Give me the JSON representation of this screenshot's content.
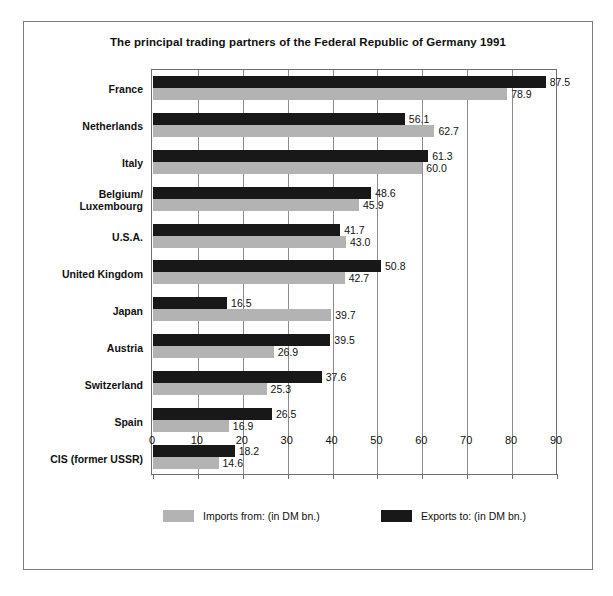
{
  "chart_data": {
    "type": "bar",
    "orientation": "horizontal",
    "title": "The principal trading partners of the Federal Republic of Germany 1991",
    "xlabel": "",
    "ylabel": "",
    "xlim": [
      0,
      90
    ],
    "xticks": [
      0,
      10,
      20,
      30,
      40,
      50,
      60,
      70,
      80,
      90
    ],
    "xtick_labels": [
      "0",
      "10",
      "20",
      "30",
      "40",
      "50",
      "60",
      "70",
      "80",
      "90"
    ],
    "grid": "vertical",
    "legend_position": "bottom",
    "categories": [
      "France",
      "Netherlands",
      "Italy",
      "Belgium/\nLuxembourg",
      "U.S.A.",
      "United Kingdom",
      "Japan",
      "Austria",
      "Switzerland",
      "Spain",
      "CIS (former USSR)"
    ],
    "series": [
      {
        "name": "Exports to: (in DM bn.)",
        "color": "#181818",
        "values": [
          87.5,
          56.1,
          61.3,
          48.6,
          41.7,
          50.8,
          16.5,
          39.5,
          37.6,
          26.5,
          18.2
        ],
        "labels": [
          "87.5",
          "56.1",
          "61.3",
          "48.6",
          "41.7",
          "50.8",
          "16.5",
          "39.5",
          "37.6",
          "26.5",
          "18.2"
        ]
      },
      {
        "name": "Imports from: (in DM bn.)",
        "color": "#b3b3b3",
        "values": [
          78.9,
          62.7,
          60.0,
          45.9,
          43.0,
          42.7,
          39.7,
          26.9,
          25.3,
          16.9,
          14.6
        ],
        "labels": [
          "78.9",
          "62.7",
          "60.0",
          "45.9",
          "43.0",
          "42.7",
          "39.7",
          "26.9",
          "25.3",
          "16.9",
          "14.6"
        ]
      }
    ]
  },
  "legend": {
    "items": [
      {
        "label": "Imports from: (in DM bn.)",
        "swatch": "imports"
      },
      {
        "label": "Exports to: (in DM bn.)",
        "swatch": "exports"
      }
    ]
  },
  "colors": {
    "exports": "#181818",
    "imports": "#b3b3b3",
    "frame": "#7a7a7a",
    "gridline": "#8c8c8c",
    "text": "#111111",
    "background": "#ffffff"
  }
}
